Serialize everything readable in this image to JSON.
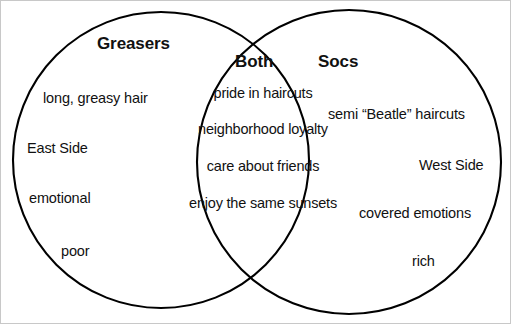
{
  "diagram": {
    "type": "venn-2-set",
    "stroke_color": "#000000",
    "background_color": "#ffffff",
    "left_set": {
      "heading": "Greasers",
      "items": [
        "long, greasy hair",
        "East Side",
        "emotional",
        "poor"
      ]
    },
    "intersection_set": {
      "heading": "Both",
      "items": [
        "pride in haircuts",
        "neighborhood loyalty",
        "care about friends",
        "enjoy the same sunsets"
      ]
    },
    "right_set": {
      "heading": "Socs",
      "items": [
        "semi “Beatle” haircuts",
        "West Side",
        "covered emotions",
        "rich"
      ]
    }
  }
}
